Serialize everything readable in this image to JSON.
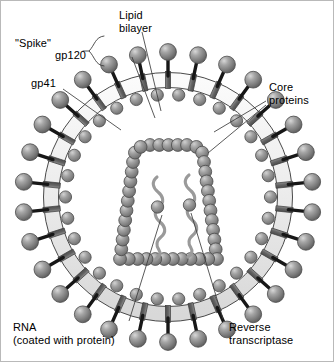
{
  "figure": {
    "background_color": "#ffffff",
    "border_color": "#b9b9b9"
  },
  "labels": {
    "spike": "\"Spike\"",
    "gp120": "gp120",
    "gp41": "gp41",
    "lipid_bilayer": "Lipid\nbilayer",
    "core_proteins": "Core\nproteins",
    "rna": "RNA\n(coated with protein)",
    "reverse_transcriptase": "Reverse\ntranscriptase"
  },
  "colors": {
    "sphere_mid": "#7d7d7d",
    "sphere_dark": "#5d5d5d",
    "sphere_light": "#c9c9c9",
    "stalk": "#1a1a1a",
    "membrane_fill": "#ededed",
    "membrane_stroke": "#4a4a4a",
    "membrane_protein": "#6f6f6f",
    "core_bead": "#8a8a8a",
    "rna_strand": "#9a9a9a",
    "leader_line": "#4a4a4a",
    "text": "#000000"
  },
  "geometry": {
    "center_x": 167,
    "center_y": 196,
    "membrane_outer_radius": 124,
    "membrane_inner_radius": 110,
    "spike_count": 30,
    "matrix_sphere_count": 30,
    "core_bead_count": 44,
    "rna_strand_count": 2,
    "reverse_transcriptase_count": 2
  },
  "structures": [
    {
      "name": "envelope-spike-gp120",
      "label": "gp120",
      "description": "outer sphere of each spike"
    },
    {
      "name": "envelope-spike-gp41",
      "label": "gp41",
      "description": "stalk anchoring spike in membrane"
    },
    {
      "name": "lipid-bilayer",
      "label": "Lipid bilayer",
      "description": "outer membrane band"
    },
    {
      "name": "core-protein",
      "label": "Core proteins",
      "description": "capsid bead shell"
    },
    {
      "name": "viral-rna",
      "label": "RNA (coated with protein)",
      "description": "two wavy strands in core"
    },
    {
      "name": "reverse-transcriptase",
      "label": "Reverse transcriptase",
      "description": "enzyme spheres on RNA"
    }
  ]
}
